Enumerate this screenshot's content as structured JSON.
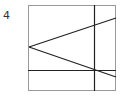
{
  "figure": {
    "label": "4",
    "box": {
      "x1": 28,
      "y1": 5,
      "x2": 116,
      "y2": 91,
      "stroke": "#999999"
    },
    "lines": [
      {
        "name": "upper-ray",
        "x1": 29,
        "y1": 47,
        "x2": 116,
        "y2": 18
      },
      {
        "name": "lower-ray",
        "x1": 29,
        "y1": 47,
        "x2": 116,
        "y2": 77
      },
      {
        "name": "horizontal-line",
        "x1": 28,
        "y1": 70,
        "x2": 116,
        "y2": 70
      },
      {
        "name": "vertical-line",
        "x1": 94,
        "y1": 5,
        "x2": 94,
        "y2": 91
      }
    ],
    "line_color": "#222222"
  }
}
